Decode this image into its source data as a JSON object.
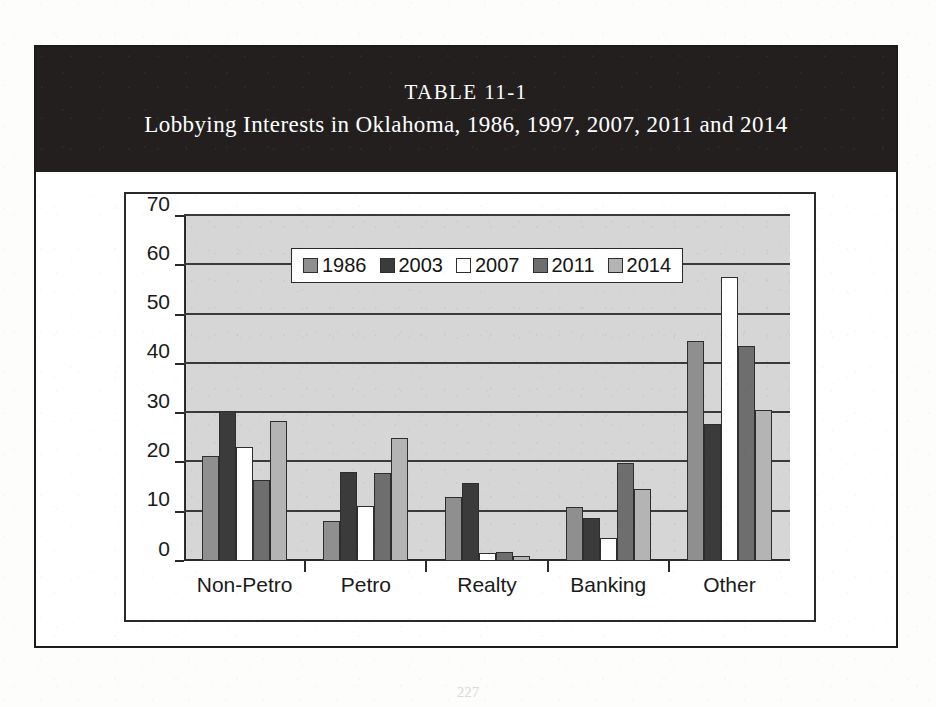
{
  "figure": {
    "table_label": "TABLE 11-1",
    "title": "Lobbying Interests in Oklahoma, 1986, 1997, 2007, 2011 and 2014",
    "page_number": "227"
  },
  "colors": {
    "banner_bg": "#231f1f",
    "banner_text": "#ffffff",
    "plot_bg": "#d6d6d6",
    "axis": "#2a2a2a",
    "gridline": "#3a3a3a",
    "series_1986": "#8f8f8f",
    "series_2003": "#3b3b3b",
    "series_2007": "#ffffff",
    "series_2011": "#6e6e6e",
    "series_2014": "#b4b4b4"
  },
  "chart_data": {
    "type": "bar",
    "title": "Lobbying Interests in Oklahoma, 1986, 1997, 2007, 2011 and 2014",
    "xlabel": "",
    "ylabel": "",
    "ylim": [
      0,
      70
    ],
    "yticks": [
      0,
      10,
      20,
      30,
      40,
      50,
      60,
      70
    ],
    "grid": true,
    "legend_position": "top-center-inside",
    "categories": [
      "Non-Petro",
      "Petro",
      "Realty",
      "Banking",
      "Other"
    ],
    "series": [
      {
        "name": "1986",
        "color": "#8f8f8f",
        "values": [
          21.0,
          7.7,
          12.5,
          10.5,
          44.3
        ]
      },
      {
        "name": "2003",
        "color": "#3b3b3b",
        "values": [
          30.0,
          17.7,
          15.5,
          8.4,
          27.4
        ]
      },
      {
        "name": "2007",
        "color": "#ffffff",
        "values": [
          22.8,
          10.7,
          1.3,
          4.3,
          57.3
        ]
      },
      {
        "name": "2011",
        "color": "#6e6e6e",
        "values": [
          16.0,
          17.5,
          1.5,
          19.5,
          43.3
        ]
      },
      {
        "name": "2014",
        "color": "#b4b4b4",
        "values": [
          28.0,
          24.5,
          0.6,
          14.3,
          30.3
        ]
      }
    ]
  }
}
